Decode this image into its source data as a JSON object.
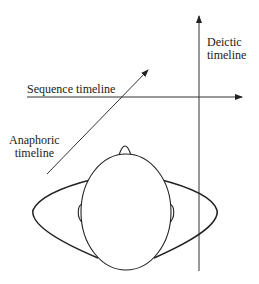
{
  "diagram": {
    "labels": {
      "deictic_line1": "Deictic",
      "deictic_line2": "timeline",
      "sequence": "Sequence timeline",
      "anaphoric_line1": "Anaphoric",
      "anaphoric_line2": "timeline"
    },
    "colors": {
      "stroke": "#222222",
      "background": "#ffffff"
    }
  }
}
